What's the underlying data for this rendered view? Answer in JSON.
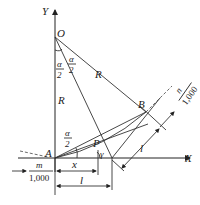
{
  "diagram": {
    "axes": {
      "x_label": "X",
      "y_label": "Y"
    },
    "points": {
      "O": "O",
      "A": "A",
      "B": "B",
      "P": "P"
    },
    "labels": {
      "R_vertical": "R",
      "R_slant": "R",
      "half_alpha_num": "α",
      "half_alpha_den": "2",
      "gamma": "γ",
      "x": "x",
      "l_bottom": "l",
      "l_slant": "l",
      "m_num": "m",
      "m_den": "1,000",
      "n_num": "n",
      "n_den": "1,000"
    },
    "colors": {
      "stroke": "#333333",
      "text": "#222222",
      "background": "#ffffff"
    }
  }
}
